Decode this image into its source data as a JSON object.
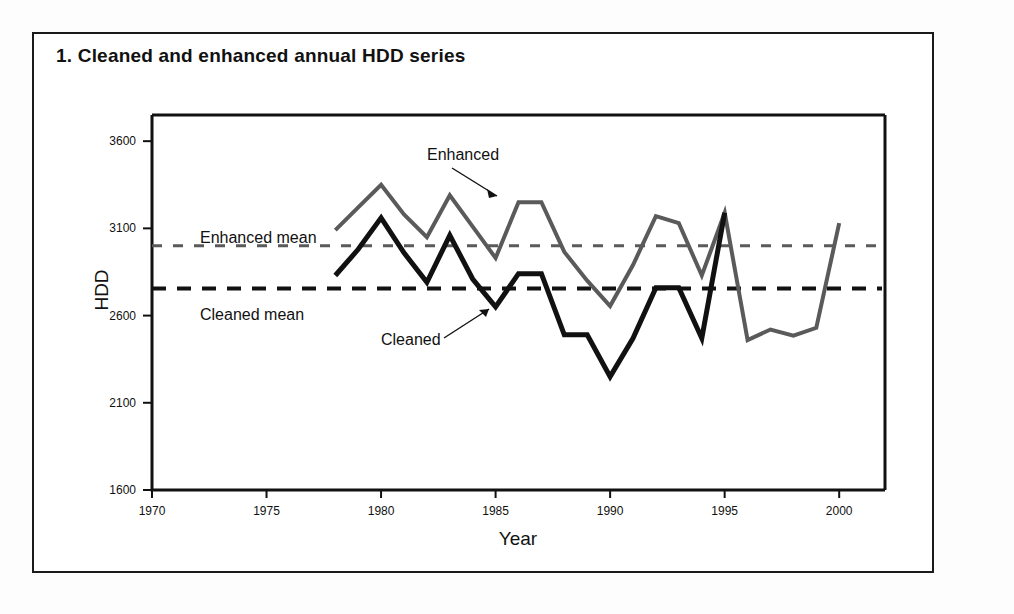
{
  "figure": {
    "number": "1.",
    "title": "1.  Cleaned and enhanced annual HDD series"
  },
  "chart_data": {
    "type": "line",
    "title": "Cleaned and enhanced annual HDD series",
    "xlabel": "Year",
    "ylabel": "HDD",
    "xlim": [
      1970,
      2002
    ],
    "ylim": [
      1600,
      3750
    ],
    "xticks": [
      1970,
      1975,
      1980,
      1985,
      1990,
      1995,
      2000
    ],
    "xtick_labels": [
      "1970",
      "1975",
      "1980",
      "1985",
      "1990",
      "1995",
      "2000"
    ],
    "yticks": [
      1600,
      2100,
      2600,
      3100,
      3600
    ],
    "ytick_labels": [
      "1600",
      "2100",
      "2600",
      "3100",
      "3600"
    ],
    "grid": false,
    "legend": "annotations",
    "series": [
      {
        "name": "Enhanced",
        "color": "#5a5a5a",
        "style": "solid",
        "width": 4,
        "x": [
          1978,
          1979,
          1980,
          1981,
          1982,
          1983,
          1984,
          1985,
          1986,
          1987,
          1988,
          1989,
          1990,
          1991,
          1992,
          1993,
          1994,
          1995,
          1996,
          1997,
          1998,
          1999,
          2000
        ],
        "y": [
          3090,
          3220,
          3350,
          3180,
          3050,
          3290,
          3110,
          2930,
          3250,
          3250,
          2965,
          2800,
          2655,
          2890,
          3170,
          3130,
          2830,
          3190,
          2460,
          2520,
          2485,
          2530,
          3130
        ]
      },
      {
        "name": "Cleaned",
        "color": "#111111",
        "style": "solid",
        "width": 5,
        "x": [
          1978,
          1979,
          1980,
          1981,
          1982,
          1983,
          1984,
          1985,
          1986,
          1987,
          1988,
          1989,
          1990,
          1991,
          1992,
          1993,
          1994,
          1995
        ],
        "y": [
          2830,
          2980,
          3160,
          2960,
          2790,
          3060,
          2810,
          2650,
          2840,
          2840,
          2490,
          2490,
          2250,
          2470,
          2760,
          2760,
          2470,
          3190
        ]
      }
    ],
    "reference_lines": [
      {
        "name": "Enhanced mean",
        "label": "Enhanced mean",
        "value": 3000,
        "color": "#5a5a5a",
        "style": "dashed"
      },
      {
        "name": "Cleaned mean",
        "label": "Cleaned mean",
        "value": 2755,
        "color": "#111111",
        "style": "dashed"
      }
    ],
    "annotations": [
      {
        "name": "enhanced-annotation",
        "text": "Enhanced",
        "x": 1985.5,
        "y": 3620
      },
      {
        "name": "cleaned-annotation",
        "text": "Cleaned",
        "x": 1982.2,
        "y": 2420
      }
    ]
  }
}
